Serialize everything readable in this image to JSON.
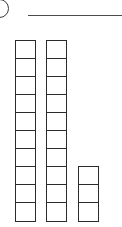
{
  "page": {
    "background_color": "#ffffff",
    "width": 122,
    "height": 227
  },
  "problem_badge": {
    "label": "",
    "shape": "circle",
    "stroke_color": "#3a3a3a",
    "clipped": "left"
  },
  "answer_rule": {
    "name": "answer-line",
    "stroke_color": "#4a4a4a"
  },
  "chart_data": {
    "type": "bar",
    "title": "",
    "xlabel": "",
    "ylabel": "",
    "categories": [
      "rod-1",
      "rod-2",
      "units"
    ],
    "values": [
      10,
      10,
      3
    ],
    "ylim": [
      0,
      10
    ],
    "grid": false,
    "legend": null
  },
  "blocks": {
    "unit_fill_color": "#ffffff",
    "unit_stroke_color": "#2b2b2b",
    "columns": [
      {
        "name": "ten-rod-1",
        "count": 10
      },
      {
        "name": "ten-rod-2",
        "count": 10
      },
      {
        "name": "ones-stack",
        "count": 3
      }
    ]
  }
}
